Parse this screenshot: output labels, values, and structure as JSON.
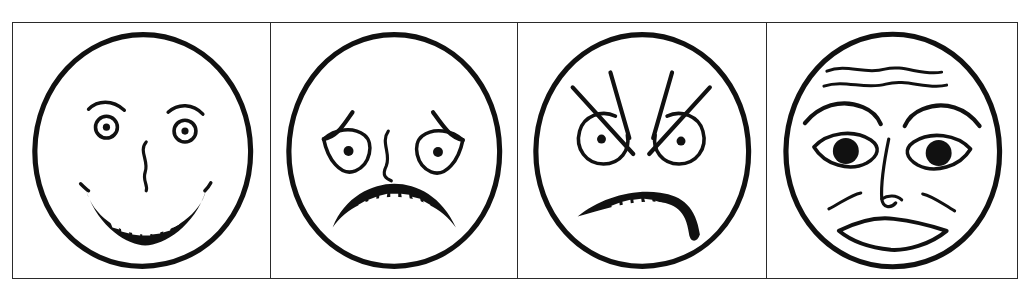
{
  "figure": {
    "kind": "line-drawing-plate",
    "panel_count": 4,
    "background_color": "#ffffff",
    "ink_color": "#111111",
    "frame_color": "#2a2a2a",
    "style_note": "hand-drawn schematic faces, black ink on white"
  },
  "panels": [
    {
      "index": "1",
      "expression": "happy",
      "label": "Happy face",
      "features": {
        "head": "large circle outline",
        "eyebrows": "two short arched strokes, raised",
        "eyes": "small rings with centered dot pupils",
        "nose": "single wavy vertical stroke",
        "mouth": "broad upturned smile band with small teeth",
        "teeth_count": "9"
      }
    },
    {
      "index": "2",
      "expression": "sad",
      "label": "Sad face",
      "features": {
        "head": "large circle outline",
        "eyebrows": "inner-raised drooping strokes over eyes",
        "eyes": "drooping almond outlines with small dot pupils",
        "nose": "single wavy vertical stroke",
        "mouth": "downturned frown band with small teeth",
        "teeth_count": "8"
      }
    },
    {
      "index": "3",
      "expression": "angry",
      "label": "Angry face",
      "features": {
        "head": "large circle outline",
        "eyebrows": "four long diagonal strokes slanting inward-down",
        "eyes": "round rings with centered dot pupils",
        "nose": "none drawn",
        "mouth": "asymmetric sneering band with teeth, dipping right",
        "teeth_count": "8"
      }
    },
    {
      "index": "4",
      "expression": "fear",
      "label": "Fearful face",
      "features": {
        "head": "large circle outline",
        "forehead": "two wavy horizontal wrinkle lines",
        "eyebrows": "high raised curved brows",
        "eyes": "wide almond outlines with large filled pupils",
        "nose": "long stroke with nostril curl",
        "cheeks": "two short curved cheek lines",
        "mouth": "open oval lips outline"
      }
    }
  ]
}
